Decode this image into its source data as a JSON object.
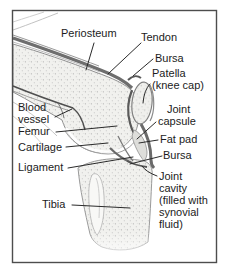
{
  "figure": {
    "colors": {
      "background": "#ffffff",
      "frame_border": "#4d4d4d",
      "label_text": "#1c1c1c",
      "leader_line": "#2a2a2a",
      "bone_fill": "#f1f1ee",
      "bone_outline": "#909090",
      "soft_tissue_dark": "#5a5a5a"
    },
    "labels": {
      "periosteum": "Periosteum",
      "tendon": "Tendon",
      "bursa_upper": "Bursa",
      "patella": "Patella\n(knee cap)",
      "joint_capsule": "Joint\ncapsule",
      "fat_pad": "Fat pad",
      "bursa_lower": "Bursa",
      "joint_cavity": "Joint\ncavity\n(filled with\nsynovial\nfluid)",
      "blood_vessel": "Blood\nvessel",
      "femur": "Femur",
      "cartilage": "Cartilage",
      "ligament": "Ligament",
      "tibia": "Tibia"
    }
  }
}
